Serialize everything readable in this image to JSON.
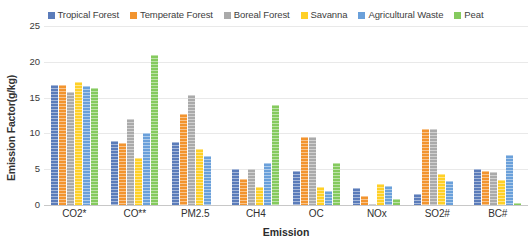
{
  "chart_data": {
    "type": "bar",
    "title": "",
    "subtitle": "",
    "xlabel": "Emission",
    "ylabel": "Emission Factor(g/kg)",
    "ylim": [
      0,
      25
    ],
    "yticks": [
      0,
      5,
      10,
      15,
      20,
      25
    ],
    "grid": true,
    "legend_position": "top-center",
    "categories": [
      "CO2*",
      "CO**",
      "PM2.5",
      "CH4",
      "OC",
      "NOx",
      "SO2#",
      "BC#"
    ],
    "series": [
      {
        "name": "Tropical Forest",
        "color": "#5b7cba",
        "values": [
          16.7,
          9.0,
          8.8,
          5.0,
          4.7,
          2.4,
          1.6,
          5.0
        ]
      },
      {
        "name": "Temperate Forest",
        "color": "#f2942f",
        "values": [
          16.7,
          8.7,
          12.7,
          3.7,
          9.5,
          1.3,
          10.6,
          4.7
        ]
      },
      {
        "name": "Boreal Forest",
        "color": "#aaaaaa",
        "values": [
          15.8,
          12.0,
          15.3,
          5.0,
          9.5,
          0.2,
          10.6,
          4.6
        ]
      },
      {
        "name": "Savanna",
        "color": "#ffd026",
        "values": [
          17.2,
          6.5,
          7.8,
          2.5,
          2.5,
          3.0,
          4.4,
          3.5
        ]
      },
      {
        "name": "Agricultural Waste",
        "color": "#6aa0da",
        "values": [
          16.6,
          10.0,
          6.8,
          5.8,
          1.9,
          2.6,
          3.3,
          7.0
        ]
      },
      {
        "name": "Peat",
        "color": "#85ca5e",
        "values": [
          16.3,
          20.9,
          0,
          14.0,
          5.8,
          0.8,
          0,
          0.3
        ]
      }
    ]
  }
}
